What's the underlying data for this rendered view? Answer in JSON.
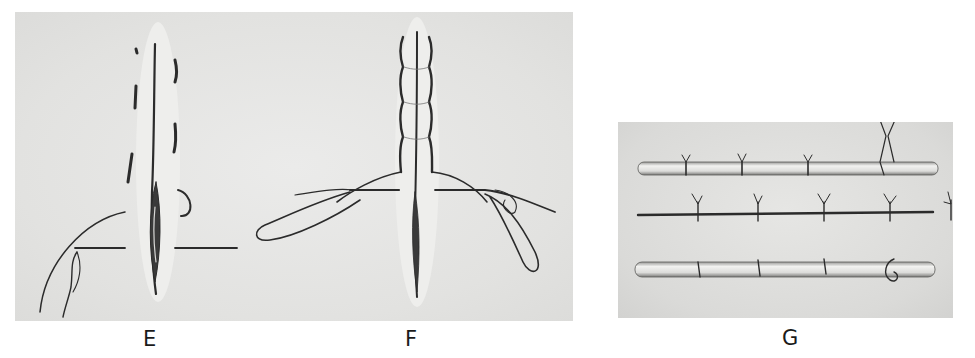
{
  "figure": {
    "panels": [
      {
        "id": "E",
        "label": "E",
        "description": "Interrupted suture along incision with loose thread ends"
      },
      {
        "id": "F",
        "label": "F",
        "description": "Continuous suture along incision with looped thread ends"
      },
      {
        "id": "G",
        "label": "G",
        "description": "Three rods showing tied sutures"
      }
    ],
    "colors": {
      "background": "#ffffff",
      "panel": "#e4e4e2",
      "ink": "#2a2a2a"
    }
  }
}
